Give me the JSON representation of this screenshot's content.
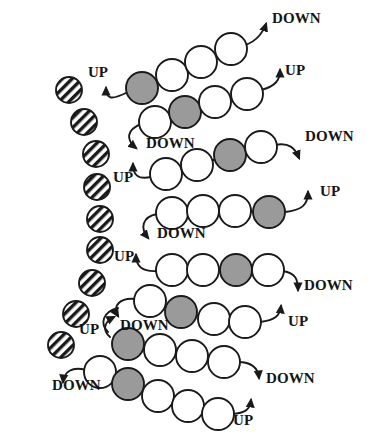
{
  "figure": {
    "type": "diagram",
    "canvas": {
      "width": 379,
      "height": 438,
      "background": "#ffffff"
    },
    "colors": {
      "stroke": "#1a1a1a",
      "white_bead_fill": "#ffffff",
      "grey_bead_fill": "#9a9a9a",
      "hatched_bead_fill": "#ffffff",
      "hatched_bead_hatch": "#1a1a1a",
      "label_color": "#151515",
      "arrow_color": "#1a1a1a"
    },
    "legend_note": "",
    "bead_types": [
      {
        "name": "hatched-bead",
        "fill": "hatch",
        "radius": 13
      },
      {
        "name": "grey-bead",
        "fill": "#9a9a9a",
        "radius": 16
      },
      {
        "name": "white-bead",
        "fill": "#ffffff",
        "radius": 16
      }
    ]
  },
  "hatched_beads": [
    {
      "id": "h1",
      "cx": 69,
      "cy": 90,
      "r": 13
    },
    {
      "id": "h2",
      "cx": 84,
      "cy": 122,
      "r": 13
    },
    {
      "id": "h3",
      "cx": 96,
      "cy": 154,
      "r": 13
    },
    {
      "id": "h4",
      "cx": 97,
      "cy": 187,
      "r": 13
    },
    {
      "id": "h5",
      "cx": 100,
      "cy": 219,
      "r": 13
    },
    {
      "id": "h6",
      "cx": 100,
      "cy": 250,
      "r": 13
    },
    {
      "id": "h7",
      "cx": 92,
      "cy": 283,
      "r": 13
    },
    {
      "id": "h8",
      "cx": 76,
      "cy": 314,
      "r": 13
    },
    {
      "id": "h9",
      "cx": 61,
      "cy": 345,
      "r": 13
    }
  ],
  "chains": [
    {
      "id": "chain-1",
      "beads": [
        {
          "type": "grey",
          "cx": 142,
          "cy": 88
        },
        {
          "type": "white",
          "cx": 172,
          "cy": 75
        },
        {
          "type": "white",
          "cx": 201,
          "cy": 62
        },
        {
          "type": "white",
          "cx": 231,
          "cy": 49
        }
      ]
    },
    {
      "id": "chain-2",
      "beads": [
        {
          "type": "white",
          "cx": 155,
          "cy": 122
        },
        {
          "type": "grey",
          "cx": 185,
          "cy": 112
        },
        {
          "type": "white",
          "cx": 215,
          "cy": 102
        },
        {
          "type": "white",
          "cx": 247,
          "cy": 94
        }
      ]
    },
    {
      "id": "chain-3",
      "beads": [
        {
          "type": "white",
          "cx": 166,
          "cy": 174
        },
        {
          "type": "white",
          "cx": 197,
          "cy": 165
        },
        {
          "type": "grey",
          "cx": 230,
          "cy": 155
        },
        {
          "type": "white",
          "cx": 261,
          "cy": 147
        }
      ]
    },
    {
      "id": "chain-4",
      "beads": [
        {
          "type": "white",
          "cx": 172,
          "cy": 213
        },
        {
          "type": "white",
          "cx": 203,
          "cy": 211
        },
        {
          "type": "white",
          "cx": 235,
          "cy": 211
        },
        {
          "type": "grey",
          "cx": 269,
          "cy": 212
        }
      ]
    },
    {
      "id": "chain-5",
      "beads": [
        {
          "type": "white",
          "cx": 172,
          "cy": 270
        },
        {
          "type": "white",
          "cx": 203,
          "cy": 270
        },
        {
          "type": "grey",
          "cx": 236,
          "cy": 270
        },
        {
          "type": "white",
          "cx": 268,
          "cy": 270
        }
      ]
    },
    {
      "id": "chain-6",
      "beads": [
        {
          "type": "white",
          "cx": 150,
          "cy": 301
        },
        {
          "type": "grey",
          "cx": 181,
          "cy": 312
        },
        {
          "type": "white",
          "cx": 214,
          "cy": 319
        },
        {
          "type": "white",
          "cx": 245,
          "cy": 322
        }
      ]
    },
    {
      "id": "chain-7",
      "beads": [
        {
          "type": "grey",
          "cx": 128,
          "cy": 344
        },
        {
          "type": "white",
          "cx": 160,
          "cy": 350
        },
        {
          "type": "white",
          "cx": 192,
          "cy": 356
        },
        {
          "type": "white",
          "cx": 224,
          "cy": 362
        }
      ]
    },
    {
      "id": "chain-8",
      "beads": [
        {
          "type": "white",
          "cx": 100,
          "cy": 372
        },
        {
          "type": "grey",
          "cx": 128,
          "cy": 384
        },
        {
          "type": "white",
          "cx": 158,
          "cy": 396
        },
        {
          "type": "white",
          "cx": 188,
          "cy": 406
        },
        {
          "type": "white",
          "cx": 218,
          "cy": 414
        }
      ]
    }
  ],
  "labels": [
    {
      "id": "lbl-up-1",
      "text": "UP",
      "x": 98,
      "y": 77,
      "anchor": "middle"
    },
    {
      "id": "lbl-down-1",
      "text": "DOWN",
      "x": 272,
      "y": 23,
      "anchor": "start"
    },
    {
      "id": "lbl-up-2",
      "text": "UP",
      "x": 285,
      "y": 75,
      "anchor": "start"
    },
    {
      "id": "lbl-down-2",
      "text": "DOWN",
      "x": 146,
      "y": 148,
      "anchor": "start"
    },
    {
      "id": "lbl-down-3",
      "text": "DOWN",
      "x": 305,
      "y": 141,
      "anchor": "start"
    },
    {
      "id": "lbl-up-3",
      "text": "UP",
      "x": 113,
      "y": 182,
      "anchor": "start"
    },
    {
      "id": "lbl-up-4",
      "text": "UP",
      "x": 320,
      "y": 196,
      "anchor": "start"
    },
    {
      "id": "lbl-down-4",
      "text": "DOWN",
      "x": 157,
      "y": 238,
      "anchor": "start"
    },
    {
      "id": "lbl-up-5",
      "text": "UP",
      "x": 114,
      "y": 261,
      "anchor": "start"
    },
    {
      "id": "lbl-down-5",
      "text": "DOWN",
      "x": 304,
      "y": 290,
      "anchor": "start"
    },
    {
      "id": "lbl-up-6",
      "text": "UP",
      "x": 79,
      "y": 334,
      "anchor": "start"
    },
    {
      "id": "lbl-down-6",
      "text": "DOWN",
      "x": 120,
      "y": 330,
      "anchor": "start"
    },
    {
      "id": "lbl-up-7",
      "text": "UP",
      "x": 288,
      "y": 326,
      "anchor": "start"
    },
    {
      "id": "lbl-down-7",
      "text": "DOWN",
      "x": 52,
      "y": 390,
      "anchor": "start"
    },
    {
      "id": "lbl-down-8",
      "text": "DOWN",
      "x": 266,
      "y": 383,
      "anchor": "start"
    },
    {
      "id": "lbl-up-8",
      "text": "UP",
      "x": 233,
      "y": 425,
      "anchor": "start"
    }
  ],
  "connectors": [
    {
      "id": "conn-1",
      "label_ref": "lbl-up-1",
      "direction": "up",
      "path": "M 128 92 C 112 100, 106 100, 106 88"
    },
    {
      "id": "conn-2",
      "label_ref": "lbl-down-1",
      "direction": "down",
      "path": "M 245 45 C 258 41, 264 30, 266 24"
    },
    {
      "id": "conn-3",
      "label_ref": "lbl-up-2",
      "direction": "up",
      "path": "M 261 90 C 276 86, 280 80, 280 70"
    },
    {
      "id": "conn-4",
      "label_ref": "lbl-down-2",
      "direction": "down",
      "path": "M 141 124 C 126 130, 126 140, 136 148"
    },
    {
      "id": "conn-5",
      "label_ref": "lbl-down-3",
      "direction": "down",
      "path": "M 275 145 C 289 142, 295 148, 299 158"
    },
    {
      "id": "conn-6",
      "label_ref": "lbl-up-3",
      "direction": "up",
      "path": "M 151 177 C 137 180, 133 174, 133 164"
    },
    {
      "id": "conn-7",
      "label_ref": "lbl-up-4",
      "direction": "up",
      "path": "M 285 212 C 302 210, 308 205, 308 192"
    },
    {
      "id": "conn-8",
      "label_ref": "lbl-down-4",
      "direction": "down",
      "path": "M 157 214 C 142 217, 140 228, 148 238"
    },
    {
      "id": "conn-9",
      "label_ref": "lbl-up-5",
      "direction": "up",
      "path": "M 157 271 C 142 272, 136 266, 136 255"
    },
    {
      "id": "conn-10",
      "label_ref": "lbl-down-5",
      "direction": "down",
      "path": "M 283 271 C 296 273, 298 280, 298 290"
    },
    {
      "id": "conn-11",
      "label_ref": "lbl-up-6",
      "direction": "up",
      "path": "M 110 337 C 102 330, 104 322, 114 317"
    },
    {
      "id": "conn-12",
      "label_ref": "lbl-down-6",
      "direction": "down",
      "path": "M 136 299 C 120 297, 112 306, 118 316"
    },
    {
      "id": "conn-13",
      "label_ref": "lbl-up-7",
      "direction": "up",
      "path": "M 260 322 C 275 320, 280 316, 281 306"
    },
    {
      "id": "conn-14",
      "label_ref": "lbl-down-7",
      "direction": "down",
      "path": "M 86 370 C 72 366, 64 372, 63 382"
    },
    {
      "id": "conn-15",
      "label_ref": "lbl-down-8",
      "direction": "down",
      "path": "M 238 362 C 252 362, 258 368, 259 378"
    },
    {
      "id": "conn-16",
      "label_ref": "lbl-up-8",
      "direction": "up",
      "path": "M 232 414 C 245 413, 250 410, 251 400"
    },
    {
      "id": "fold-1",
      "label_ref": "",
      "direction": "none",
      "path": "M 118 308 C 102 312, 100 324, 108 332"
    }
  ]
}
